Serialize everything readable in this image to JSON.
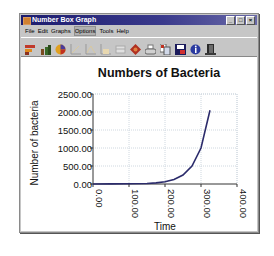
{
  "window": {
    "title": "Number Box Graph",
    "controls": [
      "minimize",
      "maximize",
      "close"
    ]
  },
  "menu": {
    "items": [
      {
        "label": "File"
      },
      {
        "label": "Edit"
      },
      {
        "label": "Graphs"
      },
      {
        "label": "Options"
      },
      {
        "label": "Tools"
      },
      {
        "label": "Help"
      }
    ]
  },
  "toolbar": {
    "icons": [
      "bar-graph-icon",
      "column-graph-icon",
      "pie-chart-icon",
      "line-graph-icon",
      "area-graph-icon",
      "step-graph-icon",
      "table-icon",
      "options-icon",
      "print-icon",
      "copy-icon",
      "save-icon",
      "info-icon",
      "exit-icon"
    ]
  },
  "chart_data": {
    "type": "line",
    "title": "Numbers of Bacteria",
    "xlabel": "Time",
    "ylabel": "Number of bacteria",
    "xlim": [
      0,
      400
    ],
    "ylim": [
      0,
      2500
    ],
    "x_ticks": [
      "0.00",
      "100.00",
      "200.00",
      "300.00",
      "400.00"
    ],
    "y_ticks": [
      "0.00",
      "500.00",
      "1000.00",
      "1500.00",
      "2000.00",
      "2500.00"
    ],
    "grid": true,
    "line_color": "#2b2b6b",
    "series": [
      {
        "name": "Number of bacteria",
        "x": [
          0,
          25,
          50,
          75,
          100,
          125,
          150,
          175,
          200,
          225,
          250,
          275,
          300,
          325
        ],
        "y": [
          1,
          2,
          4,
          8,
          16,
          32,
          64,
          128,
          60,
          125,
          250,
          500,
          1000,
          2050
        ]
      }
    ],
    "points": [
      {
        "x": 0,
        "y": 0
      },
      {
        "x": 50,
        "y": 2
      },
      {
        "x": 100,
        "y": 5
      },
      {
        "x": 150,
        "y": 15
      },
      {
        "x": 175,
        "y": 30
      },
      {
        "x": 200,
        "y": 60
      },
      {
        "x": 225,
        "y": 125
      },
      {
        "x": 250,
        "y": 250
      },
      {
        "x": 275,
        "y": 500
      },
      {
        "x": 300,
        "y": 1000
      },
      {
        "x": 325,
        "y": 2050
      }
    ]
  }
}
